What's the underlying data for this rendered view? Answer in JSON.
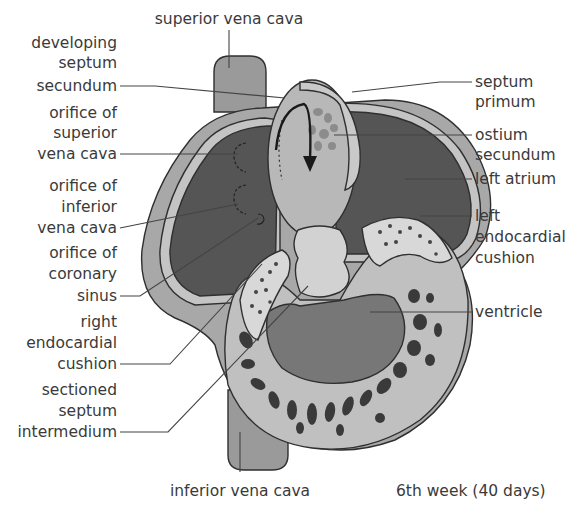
{
  "figure": {
    "caption": "6th week (40 days)"
  },
  "labels": {
    "top": [
      {
        "id": "superior-vena-cava",
        "text": "superior vena cava"
      }
    ],
    "left": [
      {
        "id": "developing-septum-secundum",
        "lines": [
          "developing",
          "septum",
          "secundum"
        ]
      },
      {
        "id": "orifice-superior-vena-cava",
        "lines": [
          "orifice of",
          "superior",
          "vena cava"
        ]
      },
      {
        "id": "orifice-inferior-vena-cava",
        "lines": [
          "orifice of",
          "inferior",
          "vena cava"
        ]
      },
      {
        "id": "orifice-coronary-sinus",
        "lines": [
          "orifice of",
          "coronary",
          "sinus"
        ]
      },
      {
        "id": "right-endocardial-cushion",
        "lines": [
          "right",
          "endocardial",
          "cushion"
        ]
      },
      {
        "id": "sectioned-septum-intermedium",
        "lines": [
          "sectioned",
          "septum",
          "intermedium"
        ]
      }
    ],
    "right": [
      {
        "id": "septum-primum",
        "lines": [
          "septum",
          "primum"
        ]
      },
      {
        "id": "ostium-secundum",
        "lines": [
          "ostium",
          "secundum"
        ]
      },
      {
        "id": "left-atrium",
        "lines": [
          "left atrium"
        ]
      },
      {
        "id": "left-endocardial-cushion",
        "lines": [
          "left",
          "endocardial",
          "cushion"
        ]
      },
      {
        "id": "ventricle",
        "lines": [
          "ventricle"
        ]
      }
    ],
    "bottom": [
      {
        "id": "inferior-vena-cava",
        "text": "inferior vena cava"
      }
    ]
  },
  "colors": {
    "background": "#ffffff",
    "vessel": "#9a9a9a",
    "outer_wall": "#a8a8a8",
    "atrium_cavity": "#555555",
    "inner_lining": "#c4c4c4",
    "septum_primum": "#b8b8b8",
    "cushion": "#d2d2d2",
    "ventricle_wall": "#c0c0c0",
    "ventricle_cavity": "#777777",
    "trabeculae": "#3a3a3a",
    "text": "#3a3a3a"
  }
}
